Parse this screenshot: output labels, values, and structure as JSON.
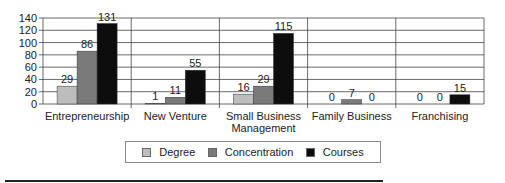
{
  "chart_data": {
    "type": "bar",
    "title": "",
    "xlabel": "",
    "ylabel": "",
    "ylim": [
      0,
      140
    ],
    "yticks": [
      0,
      20,
      40,
      60,
      80,
      100,
      120,
      140
    ],
    "grid": true,
    "legend_position": "bottom",
    "categories": [
      "Entrepreneurship",
      "New Venture",
      "Small Business Management",
      "Family Business",
      "Franchising"
    ],
    "category_label_lines": [
      [
        "Entrepreneurship"
      ],
      [
        "New Venture"
      ],
      [
        "Small Business",
        "Management"
      ],
      [
        "Family Business"
      ],
      [
        "Franchising"
      ]
    ],
    "series": [
      {
        "name": "Degree",
        "color": "#bdbdbd",
        "values": [
          29,
          1,
          16,
          0,
          0
        ]
      },
      {
        "name": "Concentration",
        "color": "#7a7a7a",
        "values": [
          86,
          11,
          29,
          7,
          0
        ]
      },
      {
        "name": "Courses",
        "color": "#0d0d0d",
        "values": [
          131,
          55,
          115,
          0,
          15
        ]
      }
    ]
  },
  "legend": {
    "items": [
      {
        "label": "Degree",
        "color": "#bdbdbd"
      },
      {
        "label": "Concentration",
        "color": "#7a7a7a"
      },
      {
        "label": "Courses",
        "color": "#0d0d0d"
      }
    ]
  }
}
